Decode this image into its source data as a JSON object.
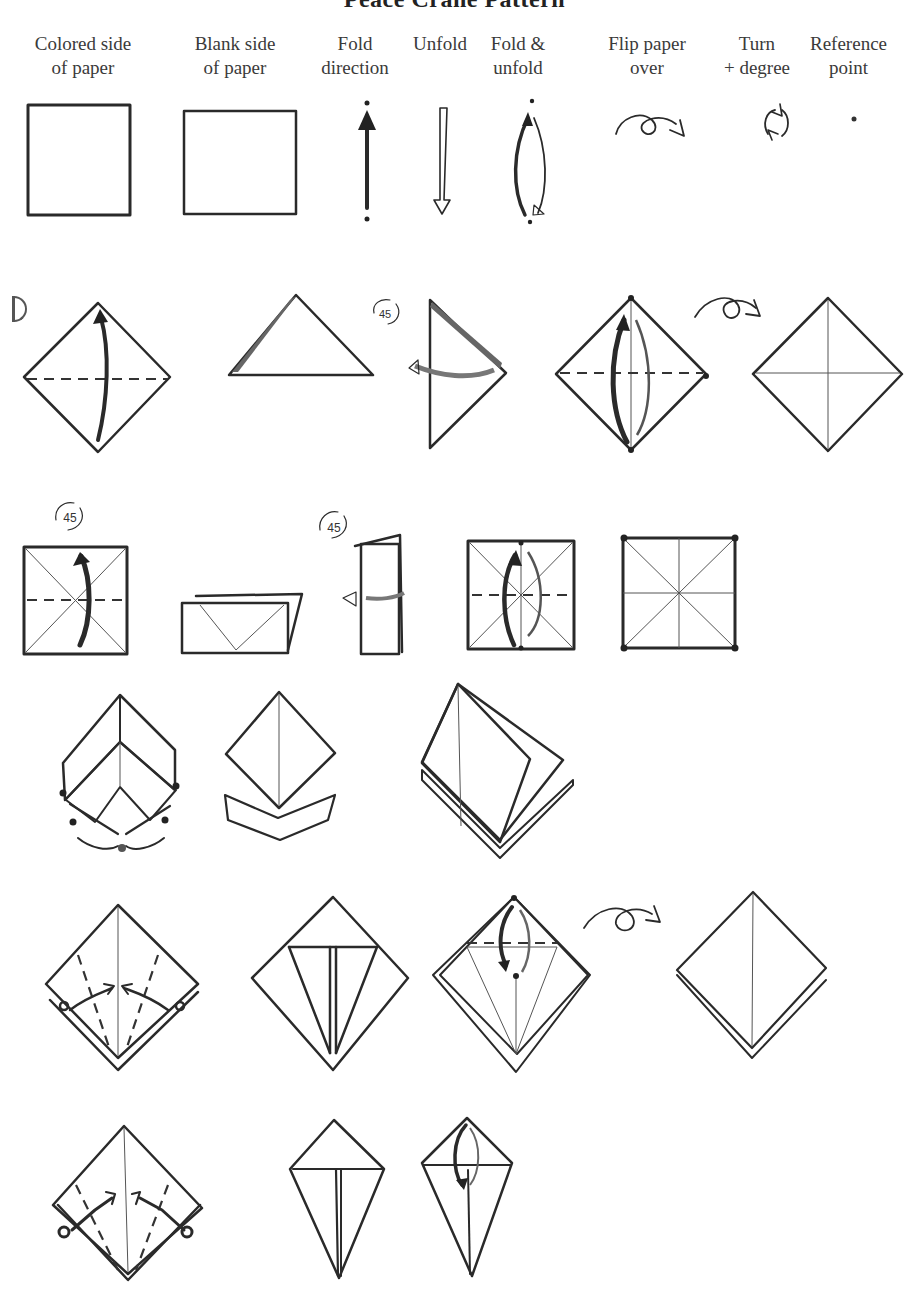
{
  "title": "Peace Crane Pattern",
  "legend": {
    "items": [
      {
        "id": "colored-side",
        "line1": "Colored side",
        "line2": "of paper",
        "symbol": "shaded-square"
      },
      {
        "id": "blank-side",
        "line1": "Blank side",
        "line2": "of paper",
        "symbol": "blank-square"
      },
      {
        "id": "fold-direction",
        "line1": "Fold",
        "line2": "direction",
        "symbol": "solid-arrow-up"
      },
      {
        "id": "unfold",
        "line1": "Unfold",
        "line2": "",
        "symbol": "hollow-arrow-down"
      },
      {
        "id": "fold-unfold",
        "line1": "Fold &",
        "line2": "unfold",
        "symbol": "double-arrow"
      },
      {
        "id": "flip-paper",
        "line1": "Flip paper",
        "line2": "over",
        "symbol": "loop-arrow"
      },
      {
        "id": "turn-degree",
        "line1": "Turn",
        "line2": "+ degree",
        "symbol": "rotate-arrows"
      },
      {
        "id": "reference-point",
        "line1": "Reference",
        "line2": "point",
        "symbol": "dot"
      }
    ]
  },
  "steps": {
    "start_number": "1",
    "rotation_label": "45"
  },
  "colors": {
    "ink": "#2a2a2a",
    "colored_paper": "#c9c9c9",
    "dark_paper": "#8a8a8a",
    "background": "#ffffff"
  }
}
